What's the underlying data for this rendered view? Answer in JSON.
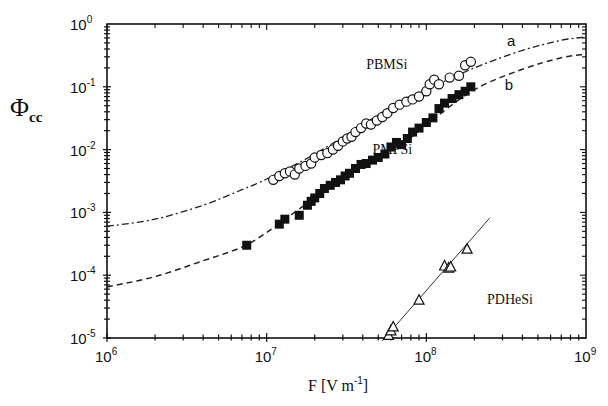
{
  "chart_data": {
    "type": "scatter",
    "title": "",
    "xlabel": "F [V m-1]",
    "xlabel_parts": {
      "base": "F [V m",
      "exp": "-1",
      "close": "]"
    },
    "ylabel": "Φcc",
    "ylabel_parts": {
      "main": "Φ",
      "sub": "cc"
    },
    "xscale": "log",
    "yscale": "log",
    "xlim": [
      1000000,
      1000000000
    ],
    "ylim": [
      1e-05,
      1
    ],
    "grid": false,
    "legend": "none (inline labels)",
    "x_ticks": [
      {
        "base": "10",
        "exp": "6",
        "value": 1000000
      },
      {
        "base": "10",
        "exp": "7",
        "value": 10000000
      },
      {
        "base": "10",
        "exp": "8",
        "value": 100000000
      },
      {
        "base": "10",
        "exp": "9",
        "value": 1000000000
      }
    ],
    "y_ticks": [
      {
        "base": "10",
        "exp": "0",
        "value": 1
      },
      {
        "base": "10",
        "exp": "-1",
        "value": 0.1
      },
      {
        "base": "10",
        "exp": "-2",
        "value": 0.01
      },
      {
        "base": "10",
        "exp": "-3",
        "value": 0.001
      },
      {
        "base": "10",
        "exp": "-4",
        "value": 0.0001
      },
      {
        "base": "10",
        "exp": "-5",
        "value": 1e-05
      }
    ],
    "annotations": [
      {
        "text": "PBMSi",
        "x": 42000000.0,
        "y": 0.19
      },
      {
        "text": "PMPSi",
        "x": 46000000.0,
        "y": 0.0085
      },
      {
        "text": "PDHeSi",
        "x": 240000000.0,
        "y": 3.5e-05
      },
      {
        "text": "a",
        "x": 320000000.0,
        "y": 0.44
      },
      {
        "text": "b",
        "x": 310000000.0,
        "y": 0.088
      }
    ],
    "series": [
      {
        "name": "PBMSi",
        "marker": "open-circle",
        "x": [
          11000000.0,
          12000000.0,
          13000000.0,
          14000000.0,
          15000000.0,
          16000000.0,
          17500000.0,
          19000000.0,
          20000000.0,
          22000000.0,
          24000000.0,
          26000000.0,
          28000000.0,
          30000000.0,
          32000000.0,
          34000000.0,
          36000000.0,
          39000000.0,
          42000000.0,
          45000000.0,
          49000000.0,
          53000000.0,
          57000000.0,
          62000000.0,
          68000000.0,
          75000000.0,
          82000000.0,
          90000000.0,
          100000000.0,
          105000000.0,
          112000000.0,
          120000000.0,
          140000000.0,
          160000000.0,
          175000000.0,
          190000000.0
        ],
        "y": [
          0.0033,
          0.0038,
          0.0042,
          0.0045,
          0.004,
          0.005,
          0.0055,
          0.006,
          0.0075,
          0.0082,
          0.0088,
          0.01,
          0.0115,
          0.0135,
          0.015,
          0.016,
          0.019,
          0.022,
          0.026,
          0.025,
          0.029,
          0.033,
          0.038,
          0.046,
          0.052,
          0.058,
          0.063,
          0.07,
          0.085,
          0.11,
          0.13,
          0.11,
          0.14,
          0.15,
          0.22,
          0.25
        ]
      },
      {
        "name": "PMPSi",
        "marker": "filled-square",
        "x": [
          7500000.0,
          12000000.0,
          13000000.0,
          16000000.0,
          18000000.0,
          19000000.0,
          20000000.0,
          21500000.0,
          23000000.0,
          25000000.0,
          27000000.0,
          29000000.0,
          31000000.0,
          33000000.0,
          36000000.0,
          39000000.0,
          42000000.0,
          46000000.0,
          50000000.0,
          55000000.0,
          60000000.0,
          65000000.0,
          70000000.0,
          76000000.0,
          82000000.0,
          90000000.0,
          100000000.0,
          110000000.0,
          120000000.0,
          130000000.0,
          145000000.0,
          160000000.0,
          175000000.0,
          190000000.0
        ],
        "y": [
          0.0003,
          0.00065,
          0.00078,
          0.0009,
          0.0013,
          0.0015,
          0.0017,
          0.002,
          0.0024,
          0.0027,
          0.003,
          0.0033,
          0.0038,
          0.0042,
          0.005,
          0.0058,
          0.006,
          0.0068,
          0.0075,
          0.0085,
          0.011,
          0.013,
          0.012,
          0.015,
          0.019,
          0.022,
          0.027,
          0.032,
          0.045,
          0.055,
          0.065,
          0.075,
          0.085,
          0.1
        ]
      },
      {
        "name": "PDHeSi",
        "marker": "open-triangle",
        "x": [
          58000000.0,
          60000000.0,
          62000000.0,
          90000000.0,
          130000000.0,
          138000000.0,
          142000000.0,
          180000000.0
        ],
        "y": [
          1.1e-05,
          1.3e-05,
          1.5e-05,
          4e-05,
          0.00014,
          0.00013,
          0.000135,
          0.00026
        ],
        "fit_line": {
          "style": "solid",
          "x": [
            53000000.0,
            250000000.0
          ],
          "y": [
            9e-06,
            0.00082
          ]
        }
      },
      {
        "name": "a",
        "style": "dash-dot",
        "x": [
          1000000.0,
          2000000.0,
          4000000.0,
          7000000.0,
          10000000.0,
          20000000.0,
          40000000.0,
          70000000.0,
          100000000.0,
          200000000.0,
          400000000.0,
          700000000.0,
          1000000000.0
        ],
        "y": [
          0.0006,
          0.00078,
          0.0013,
          0.0023,
          0.0034,
          0.0085,
          0.025,
          0.06,
          0.09,
          0.2,
          0.38,
          0.55,
          0.62
        ]
      },
      {
        "name": "b",
        "style": "dashed",
        "x": [
          1000000.0,
          2000000.0,
          4000000.0,
          7000000.0,
          10000000.0,
          20000000.0,
          40000000.0,
          70000000.0,
          100000000.0,
          200000000.0,
          400000000.0,
          700000000.0,
          1000000000.0
        ],
        "y": [
          6.5e-05,
          9.5e-05,
          0.00017,
          0.00028,
          0.00048,
          0.0017,
          0.0055,
          0.012,
          0.025,
          0.09,
          0.19,
          0.29,
          0.33
        ]
      }
    ]
  }
}
